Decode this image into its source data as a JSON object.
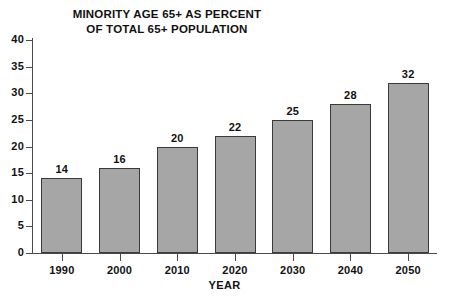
{
  "chart_data": {
    "type": "bar",
    "title": "MINORITY AGE 65+ AS PERCENT OF TOTAL 65+ POPULATION",
    "title_lines": [
      "MINORITY AGE 65+ AS PERCENT",
      "OF TOTAL 65+ POPULATION"
    ],
    "xlabel": "YEAR",
    "ylabel": "",
    "categories": [
      "1990",
      "2000",
      "2010",
      "2020",
      "2030",
      "2040",
      "2050"
    ],
    "values": [
      14,
      16,
      20,
      22,
      25,
      28,
      32
    ],
    "data_labels": [
      "14",
      "16",
      "20",
      "22",
      "25",
      "28",
      "32"
    ],
    "ylim": [
      0,
      40
    ],
    "y_ticks": [
      0,
      5,
      10,
      15,
      20,
      25,
      30,
      35,
      40
    ],
    "y_tick_labels": [
      "0",
      "5",
      "10",
      "15",
      "20",
      "25",
      "30",
      "35",
      "40"
    ],
    "grid": false,
    "legend": null,
    "bar_color": "#a6a6a6",
    "bar_border_color": "#3a3a3a",
    "axis_color": "#4a4a4a",
    "background_color": "#ffffff"
  }
}
